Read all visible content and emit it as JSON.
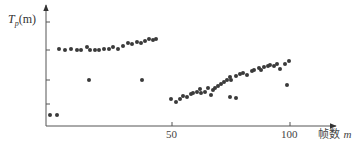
{
  "chart_data": {
    "type": "scatter",
    "title": "",
    "ylabel": "T_p(m)",
    "ylabel_parts": {
      "main": "T",
      "sub": "p",
      "rest": "(m)"
    },
    "xlabel": "帧数 m",
    "xlabel_parts": {
      "text": "帧数",
      "var": "m"
    },
    "x_ticks": [
      50,
      100
    ],
    "x_tick_labels": [
      "50",
      "100"
    ],
    "y_ticks_unlabeled": 4,
    "xlim": [
      -3,
      120
    ],
    "grid": false,
    "legend": null,
    "series": [
      {
        "name": "T_p(m)",
        "color": "#3a3a3a",
        "points_px": [
          [
            50,
            115
          ],
          [
            57,
            115
          ],
          [
            59,
            49
          ],
          [
            65,
            50
          ],
          [
            71,
            49
          ],
          [
            77,
            50
          ],
          [
            81,
            50
          ],
          [
            87,
            47
          ],
          [
            90,
            50
          ],
          [
            95,
            50
          ],
          [
            99,
            50
          ],
          [
            104,
            49
          ],
          [
            109,
            49
          ],
          [
            113,
            47
          ],
          [
            118,
            49
          ],
          [
            123,
            46
          ],
          [
            128,
            43
          ],
          [
            132,
            44
          ],
          [
            137,
            42
          ],
          [
            141,
            43
          ],
          [
            145,
            41
          ],
          [
            149,
            39
          ],
          [
            153,
            40
          ],
          [
            156,
            39
          ],
          [
            89,
            80
          ],
          [
            142,
            80
          ],
          [
            171,
            99
          ],
          [
            176,
            102
          ],
          [
            180,
            99
          ],
          [
            183,
            96
          ],
          [
            187,
            97
          ],
          [
            191,
            94
          ],
          [
            193,
            93
          ],
          [
            197,
            92
          ],
          [
            200,
            89
          ],
          [
            201,
            93
          ],
          [
            205,
            92
          ],
          [
            208,
            88
          ],
          [
            211,
            95
          ],
          [
            213,
            90
          ],
          [
            215,
            88
          ],
          [
            218,
            86
          ],
          [
            221,
            84
          ],
          [
            224,
            82
          ],
          [
            227,
            80
          ],
          [
            230,
            77
          ],
          [
            231,
            80
          ],
          [
            236,
            76
          ],
          [
            240,
            74
          ],
          [
            243,
            73
          ],
          [
            247,
            75
          ],
          [
            252,
            71
          ],
          [
            254,
            70
          ],
          [
            259,
            68
          ],
          [
            261,
            70
          ],
          [
            264,
            67
          ],
          [
            268,
            66
          ],
          [
            270,
            65
          ],
          [
            274,
            66
          ],
          [
            277,
            64
          ],
          [
            280,
            69
          ],
          [
            285,
            64
          ],
          [
            289,
            61
          ],
          [
            230,
            97
          ],
          [
            236,
            98
          ],
          [
            287,
            85
          ]
        ],
        "approx_frames": [
          -2,
          1,
          2,
          4,
          7,
          9,
          11,
          14,
          15,
          17,
          19,
          21,
          23,
          25,
          27,
          29,
          31,
          33,
          35,
          37,
          39,
          40,
          42,
          43,
          15,
          37,
          50,
          52,
          54,
          55,
          56,
          58,
          59,
          61,
          62,
          62,
          64,
          65,
          66,
          67,
          68,
          69,
          71,
          72,
          73,
          75,
          75,
          77,
          79,
          80,
          82,
          84,
          85,
          87,
          88,
          89,
          91,
          92,
          93,
          94,
          96,
          98,
          99,
          75,
          77,
          99
        ]
      }
    ]
  },
  "axes": {
    "origin": [
      46,
      126
    ],
    "y_top": 5,
    "x_right": 335,
    "y_tick_px": [
      22,
      50,
      80,
      104
    ],
    "x_tick_px": [
      172,
      290
    ]
  }
}
